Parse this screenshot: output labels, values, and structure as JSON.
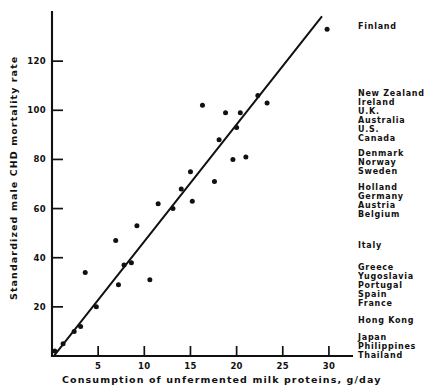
{
  "chart_data": {
    "type": "scatter",
    "title": "",
    "xlabel": "Consumption of unfermented milk proteins, g/day",
    "ylabel": "Standardized male CHD mortality rate",
    "xlim": [
      0,
      32.5
    ],
    "ylim": [
      0,
      140
    ],
    "xticks": [
      5,
      10,
      15,
      20,
      25,
      30
    ],
    "yticks": [
      20,
      40,
      60,
      80,
      100,
      120
    ],
    "xtick_labels": [
      "5",
      "10",
      "15",
      "20",
      "25",
      "30"
    ],
    "ytick_labels": [
      "20",
      "40",
      "60",
      "80",
      "100",
      "120"
    ],
    "grid": false,
    "legend": "none",
    "points": [
      {
        "x": 0.3,
        "y": 2
      },
      {
        "x": 1.2,
        "y": 5
      },
      {
        "x": 2.4,
        "y": 10
      },
      {
        "x": 3.1,
        "y": 12
      },
      {
        "x": 3.6,
        "y": 34
      },
      {
        "x": 4.8,
        "y": 20
      },
      {
        "x": 6.9,
        "y": 47
      },
      {
        "x": 7.2,
        "y": 29
      },
      {
        "x": 7.8,
        "y": 37
      },
      {
        "x": 8.6,
        "y": 38
      },
      {
        "x": 9.2,
        "y": 53
      },
      {
        "x": 10.6,
        "y": 31
      },
      {
        "x": 11.5,
        "y": 62
      },
      {
        "x": 13.1,
        "y": 60
      },
      {
        "x": 14.0,
        "y": 68
      },
      {
        "x": 15.0,
        "y": 75
      },
      {
        "x": 15.2,
        "y": 63
      },
      {
        "x": 16.3,
        "y": 102
      },
      {
        "x": 17.6,
        "y": 71
      },
      {
        "x": 18.1,
        "y": 88
      },
      {
        "x": 18.8,
        "y": 99
      },
      {
        "x": 19.6,
        "y": 80
      },
      {
        "x": 20.0,
        "y": 93
      },
      {
        "x": 20.4,
        "y": 99
      },
      {
        "x": 21.0,
        "y": 81
      },
      {
        "x": 22.3,
        "y": 106
      },
      {
        "x": 23.3,
        "y": 103
      },
      {
        "x": 29.8,
        "y": 133
      }
    ],
    "fit_line": {
      "x0": 0.3,
      "y0": 0.5,
      "x1": 29.2,
      "y1": 138
    }
  },
  "country_annotations": [
    {
      "name": "Finland",
      "top": 22
    },
    {
      "name": "New Zealand",
      "top": 89
    },
    {
      "name": "Ireland",
      "top": 98
    },
    {
      "name": "U.K.",
      "top": 107
    },
    {
      "name": "Australia",
      "top": 116
    },
    {
      "name": "U.S.",
      "top": 125
    },
    {
      "name": "Canada",
      "top": 134
    },
    {
      "name": "Denmark",
      "top": 149
    },
    {
      "name": "Norway",
      "top": 158
    },
    {
      "name": "Sweden",
      "top": 167
    },
    {
      "name": "Holland",
      "top": 183
    },
    {
      "name": "Germany",
      "top": 192
    },
    {
      "name": "Austria",
      "top": 201
    },
    {
      "name": "Belgium",
      "top": 210
    },
    {
      "name": "Italy",
      "top": 241
    },
    {
      "name": "Greece",
      "top": 263
    },
    {
      "name": "Yugoslavia",
      "top": 272
    },
    {
      "name": "Portugal",
      "top": 281
    },
    {
      "name": "Spain",
      "top": 290
    },
    {
      "name": "France",
      "top": 299
    },
    {
      "name": "Hong Kong",
      "top": 316
    },
    {
      "name": "Japan",
      "top": 333
    },
    {
      "name": "Philippines",
      "top": 342
    },
    {
      "name": "Thailand",
      "top": 351
    }
  ]
}
